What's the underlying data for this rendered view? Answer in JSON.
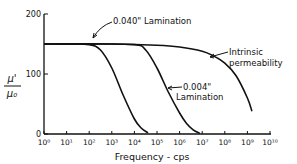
{
  "chart_data": {
    "type": "line",
    "title": "",
    "xlabel": "Frequency - cps",
    "ylabel_num": "μ'",
    "ylabel_den": "μ₀",
    "x_scale": "log",
    "xlim_exp": [
      0,
      10
    ],
    "ylim": [
      0,
      200
    ],
    "x_ticks": [
      "10⁰",
      "10¹",
      "10²",
      "10³",
      "10⁴",
      "10⁵",
      "10⁶",
      "10⁷",
      "10⁸",
      "10⁹",
      "10¹⁰"
    ],
    "y_ticks": [
      "0",
      "100",
      "200"
    ],
    "y_tick_values": [
      0,
      100,
      200
    ],
    "grid": false,
    "series": [
      {
        "name": "0.040\" Lamination",
        "log10_x": [
          0,
          1,
          2,
          2.5,
          3,
          3.5,
          4,
          4.3,
          4.6
        ],
        "y": [
          150,
          150,
          149,
          140,
          110,
          65,
          25,
          10,
          2
        ]
      },
      {
        "name": "0.004\" Lamination",
        "log10_x": [
          0,
          2,
          4,
          4.5,
          5,
          5.5,
          6,
          6.3,
          6.6,
          6.9
        ],
        "y": [
          150,
          150,
          149,
          140,
          110,
          70,
          35,
          18,
          7,
          1
        ]
      },
      {
        "name": "Intrinsic permeability",
        "log10_x": [
          0,
          3,
          5,
          6,
          7,
          7.5,
          8,
          8.5,
          9,
          9.2
        ],
        "y": [
          150,
          150,
          148,
          145,
          138,
          130,
          118,
          97,
          60,
          38
        ]
      }
    ],
    "annotations": [
      {
        "text": "0.040\" Lamination",
        "target_series": 0
      },
      {
        "text_line1": "0.004\"",
        "text_line2": "Lamination",
        "target_series": 1
      },
      {
        "text_line1": "Intrinsic",
        "text_line2": "permeability",
        "target_series": 2
      }
    ]
  }
}
